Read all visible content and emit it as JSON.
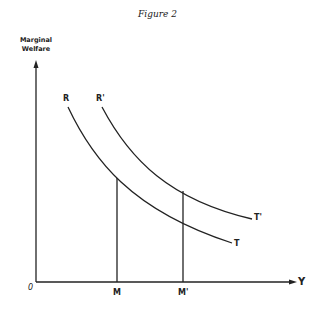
{
  "title": "Figure 2",
  "axes": {
    "y_label_line1": "Marginal",
    "y_label_line2": "Welfare",
    "x_label": "Y",
    "origin_label": "0"
  },
  "curves": [
    {
      "name": "RT",
      "start_label": "R",
      "end_label": "T"
    },
    {
      "name": "R'T'",
      "start_label": "R'",
      "end_label": "T'"
    }
  ],
  "markers": [
    {
      "label": "M"
    },
    {
      "label": "M'"
    }
  ],
  "colors": {
    "ink": "#222222",
    "background": "#ffffff"
  }
}
